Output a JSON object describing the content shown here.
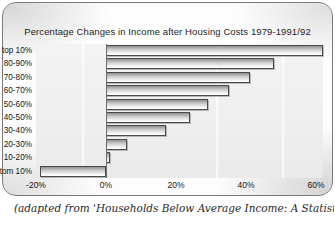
{
  "chart_data": {
    "type": "bar",
    "orientation": "horizontal",
    "title": "Percentage Changes in Income after Housing Costs 1979-1991/92",
    "xlabel": "",
    "ylabel": "",
    "categories": [
      "top 10%",
      "80-90%",
      "70-80%",
      "60-70%",
      "50-60%",
      "40-50%",
      "30-40%",
      "20-30%",
      "10-20%",
      "bottom 10%"
    ],
    "values": [
      62,
      48,
      41,
      35,
      29,
      24,
      17,
      6,
      1,
      -19
    ],
    "xlim": [
      -20,
      62
    ],
    "xticks": [
      -20,
      0,
      20,
      40,
      60
    ],
    "xtick_labels": [
      "-20%",
      "0%",
      "20%",
      "40%",
      "60%"
    ],
    "grid": false,
    "legend": "none",
    "zero_line": true
  },
  "caption": {
    "text": "(adapted from 'Households Below Average Income: A Statistical Analysis"
  },
  "colors": {
    "bar_fill_light": "#ffffff",
    "bar_fill_dark": "#8f8f8f",
    "bar_border": "#4a4a4a",
    "plot_background": "#efefef",
    "axis": "#6d6d6d",
    "text": "#161616"
  }
}
